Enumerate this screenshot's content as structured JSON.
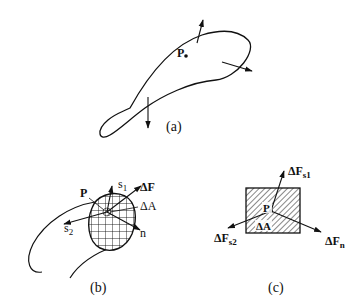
{
  "figure": {
    "panels": [
      {
        "id": "a",
        "caption": "(a)",
        "description": "Curved elongated body with a point P inside and three surface force arrows",
        "labels": {
          "point": "P"
        }
      },
      {
        "id": "b",
        "caption": "(b)",
        "description": "Body cut by a section; cross-hatched cut face with area element at P",
        "labels": {
          "point": "P",
          "tangent1": "s",
          "tangent1_sub": "1",
          "tangent2": "s",
          "tangent2_sub": "2",
          "force": "ΔF",
          "area": "ΔA",
          "normal": "n"
        }
      },
      {
        "id": "c",
        "caption": "(c)",
        "description": "Hatched rectangle area element ΔA with force components at P",
        "labels": {
          "point": "P",
          "area": "ΔA",
          "fs1": "ΔF",
          "fs1_sub": "s1",
          "fs2": "ΔF",
          "fs2_sub": "s2",
          "fn": "ΔF",
          "fn_sub": "n"
        }
      }
    ],
    "colors": {
      "ink": "#111111",
      "background": "#ffffff"
    }
  }
}
